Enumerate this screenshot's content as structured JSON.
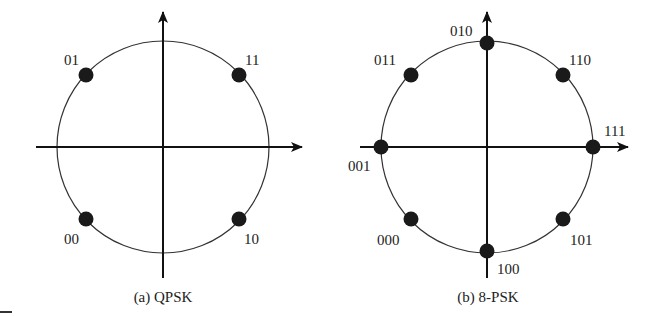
{
  "figures": [
    {
      "id": "qpsk",
      "caption": "(a) QPSK",
      "center": [
        163,
        147
      ],
      "radius": 106,
      "axes": {
        "x_from": 36,
        "x_to": 302,
        "y_from": 278,
        "y_to": 12
      },
      "points": [
        {
          "label": "01",
          "x": 86,
          "y": 75,
          "lx": 64,
          "ly": 65
        },
        {
          "label": "11",
          "x": 239,
          "y": 75,
          "lx": 245,
          "ly": 65
        },
        {
          "label": "00",
          "x": 86,
          "y": 219,
          "lx": 64,
          "ly": 244
        },
        {
          "label": "10",
          "x": 239,
          "y": 219,
          "lx": 244,
          "ly": 244
        }
      ]
    },
    {
      "id": "8psk",
      "caption": "(b) 8-PSK",
      "center": [
        487,
        147
      ],
      "radius": 106,
      "axes": {
        "x_from": 360,
        "x_to": 628,
        "y_from": 278,
        "y_to": 12
      },
      "points": [
        {
          "label": "010",
          "x": 487,
          "y": 43,
          "lx": 450,
          "ly": 36
        },
        {
          "label": "011",
          "x": 411,
          "y": 75,
          "lx": 374,
          "ly": 65
        },
        {
          "label": "110",
          "x": 563,
          "y": 75,
          "lx": 569,
          "ly": 65
        },
        {
          "label": "001",
          "x": 381,
          "y": 147,
          "lx": 348,
          "ly": 171
        },
        {
          "label": "111",
          "x": 593,
          "y": 147,
          "lx": 604,
          "ly": 136
        },
        {
          "label": "000",
          "x": 411,
          "y": 219,
          "lx": 377,
          "ly": 245
        },
        {
          "label": "101",
          "x": 563,
          "y": 219,
          "lx": 570,
          "ly": 245
        },
        {
          "label": "100",
          "x": 487,
          "y": 251,
          "lx": 497,
          "ly": 274
        }
      ]
    }
  ],
  "colors": {
    "line": "#111111",
    "dot": "#1a1a1a",
    "circle": "#333333"
  }
}
